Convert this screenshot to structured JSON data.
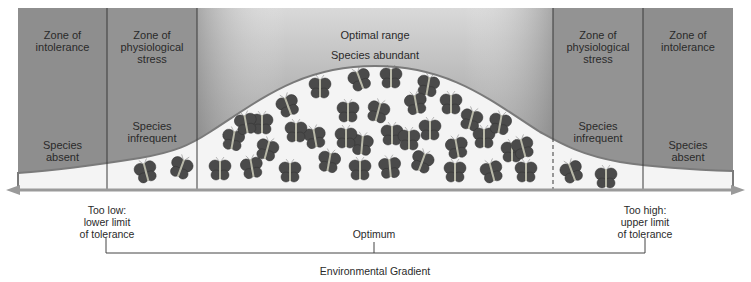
{
  "zones": [
    {
      "id": "intolerance-low",
      "heading": "Zone of\nintolerance",
      "status": "Species\nabsent"
    },
    {
      "id": "stress-low",
      "heading": "Zone of\nphysiological\nstress",
      "status": "Species\ninfrequent"
    },
    {
      "id": "optimal",
      "heading": "Optimal range",
      "status": "Species abundant"
    },
    {
      "id": "stress-high",
      "heading": "Zone of\nphysiological\nstress",
      "status": "Species\ninfrequent"
    },
    {
      "id": "intolerance-high",
      "heading": "Zone of\nintolerance",
      "status": "Species\nabsent"
    }
  ],
  "axis": {
    "low_label": "Too low:\nlower limit\nof tolerance",
    "optimum_label": "Optimum",
    "high_label": "Too high:\nupper limit\nof tolerance",
    "gradient_label": "Environmental Gradient"
  },
  "colors": {
    "zone_fill": "#8c8c8c",
    "optimal_top": "#8f8f8f",
    "optimal_bottom": "#dcdcdc",
    "curve_fill": "#f4f4f4",
    "curve_stroke": "#7a7a7a",
    "butterfly": "#4a4a4a",
    "arrow": "#9a9a9a"
  },
  "butterfly_counts": {
    "stress-low": 2,
    "optimal": 52,
    "stress-high": 2
  }
}
